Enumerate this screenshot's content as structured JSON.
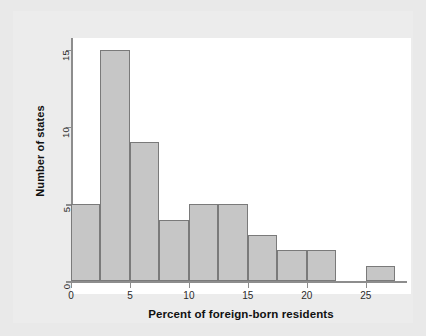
{
  "chart_data": {
    "type": "bar",
    "title": "",
    "subtitle": "",
    "xlabel": "Percent of foreign-born residents",
    "ylabel": "Number of states",
    "bin_width": 2.5,
    "bin_edges": [
      0,
      2.5,
      5,
      7.5,
      10,
      12.5,
      15,
      17.5,
      20,
      22.5,
      25,
      27.5
    ],
    "categories": [
      "0-2.5",
      "2.5-5",
      "5-7.5",
      "7.5-10",
      "10-12.5",
      "12.5-15",
      "15-17.5",
      "17.5-20",
      "20-22.5",
      "22.5-25",
      "25-27.5"
    ],
    "values": [
      5,
      15,
      9,
      4,
      5,
      5,
      3,
      2,
      2,
      0,
      1
    ],
    "xlim": [
      0,
      28.5
    ],
    "ylim": [
      0,
      15.75
    ],
    "xticks": [
      0,
      5,
      10,
      15,
      20,
      25
    ],
    "xtick_labels": [
      "0",
      "5",
      "10",
      "15",
      "20",
      "25"
    ],
    "yticks": [
      0,
      5,
      10,
      15
    ],
    "ytick_labels": [
      "0",
      "5",
      "10",
      "15"
    ],
    "grid": false,
    "legend": false,
    "legend_position": "none",
    "bar_fill_color": "#c6c6c6",
    "bar_edge_color": "#7a7a7a",
    "axis_color": "#8d8d8d",
    "plot_background": "#ffffff",
    "figure_background": "#e9e9e9",
    "annotations": []
  }
}
